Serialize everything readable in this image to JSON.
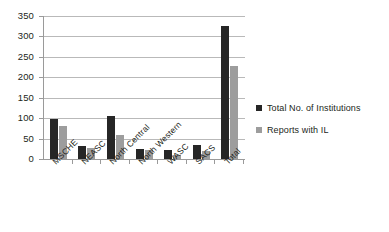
{
  "chart_data": {
    "type": "bar",
    "title": "",
    "subtitle": "",
    "xlabel": "",
    "ylabel": "",
    "ylim": [
      0,
      350
    ],
    "ytick_step": 50,
    "yticks": [
      0,
      50,
      100,
      150,
      200,
      250,
      300,
      350
    ],
    "ytick_labels": [
      "0",
      "50",
      "100",
      "150",
      "200",
      "250",
      "300",
      "350"
    ],
    "grid": true,
    "grid_axis": "y",
    "legend_position": "right",
    "categories": [
      "MSCHE",
      "NEASC",
      "North Central",
      "North Western",
      "WASC",
      "SACS",
      "Total"
    ],
    "series": [
      {
        "name": "Total No. of Institutions",
        "color": "#262626",
        "values": [
          97,
          32,
          105,
          25,
          22,
          35,
          325
        ]
      },
      {
        "name": "Reports with IL",
        "color": "#9d9d9d",
        "values": [
          80,
          28,
          58,
          22,
          10,
          20,
          228
        ]
      }
    ]
  },
  "legend": {
    "items": [
      {
        "label": "Total No. of Institutions",
        "color": "#262626"
      },
      {
        "label": "Reports with IL",
        "color": "#9d9d9d"
      }
    ]
  },
  "colors": {
    "background": "#ffffff",
    "axis": "#9a9a9a",
    "gridline": "#b9b9b9",
    "text": "#231f20",
    "series_0": "#262626",
    "series_1": "#9d9d9d"
  }
}
